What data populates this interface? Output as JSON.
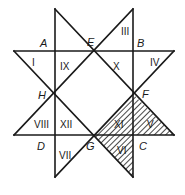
{
  "diagram": {
    "type": "eight-pointed-star",
    "colors": {
      "line": "#1a1a1a",
      "background": "#ffffff",
      "hatch": "#1a1a1a"
    },
    "points": [
      {
        "id": "A",
        "label": "A",
        "x": 55,
        "y": 51,
        "lx": 40,
        "ly": 47
      },
      {
        "id": "B",
        "label": "B",
        "x": 133,
        "y": 51,
        "lx": 137,
        "ly": 47
      },
      {
        "id": "C",
        "label": "C",
        "x": 133,
        "y": 135,
        "lx": 139,
        "ly": 150
      },
      {
        "id": "D",
        "label": "D",
        "x": 55,
        "y": 135,
        "lx": 37,
        "ly": 150
      },
      {
        "id": "E",
        "label": "E",
        "x": 93,
        "y": 51,
        "lx": 87,
        "ly": 46
      },
      {
        "id": "F",
        "label": "F",
        "x": 133,
        "y": 94,
        "lx": 142,
        "ly": 97
      },
      {
        "id": "G",
        "label": "G",
        "x": 93,
        "y": 135,
        "lx": 86,
        "ly": 150
      },
      {
        "id": "H",
        "label": "H",
        "x": 55,
        "y": 94,
        "lx": 38,
        "ly": 99
      }
    ],
    "regions": [
      {
        "id": "I",
        "label": "I",
        "x": 32,
        "y": 66,
        "hatched": false
      },
      {
        "id": "II",
        "label": "II",
        "x": 0,
        "y": 0,
        "hatched": false,
        "visible": false
      },
      {
        "id": "III",
        "label": "III",
        "x": 121,
        "y": 35,
        "hatched": false
      },
      {
        "id": "IV",
        "label": "IV",
        "x": 150,
        "y": 66,
        "hatched": false
      },
      {
        "id": "V",
        "label": "V",
        "x": 147,
        "y": 128,
        "hatched": true
      },
      {
        "id": "VI",
        "label": "VI",
        "x": 117,
        "y": 154,
        "hatched": true
      },
      {
        "id": "VII",
        "label": "VII",
        "x": 59,
        "y": 159,
        "hatched": false
      },
      {
        "id": "VIII",
        "label": "VIII",
        "x": 34,
        "y": 128,
        "hatched": false
      },
      {
        "id": "IX",
        "label": "IX",
        "x": 60,
        "y": 70,
        "hatched": false
      },
      {
        "id": "X",
        "label": "X",
        "x": 112,
        "y": 70,
        "hatched": false
      },
      {
        "id": "XI",
        "label": "XI",
        "x": 114,
        "y": 128,
        "hatched": true
      },
      {
        "id": "XII",
        "label": "XII",
        "x": 60,
        "y": 128,
        "hatched": false
      }
    ],
    "labels": {
      "A": "A",
      "B": "B",
      "C": "C",
      "D": "D",
      "E": "E",
      "F": "F",
      "G": "G",
      "H": "H",
      "I": "I",
      "III": "III",
      "IV": "IV",
      "V": "V",
      "VI": "VI",
      "VII": "VII",
      "VIII": "VIII",
      "IX": "IX",
      "X": "X",
      "XI": "XI",
      "XII": "XII"
    },
    "hatched_regions": [
      "XI",
      "V",
      "VI"
    ]
  }
}
